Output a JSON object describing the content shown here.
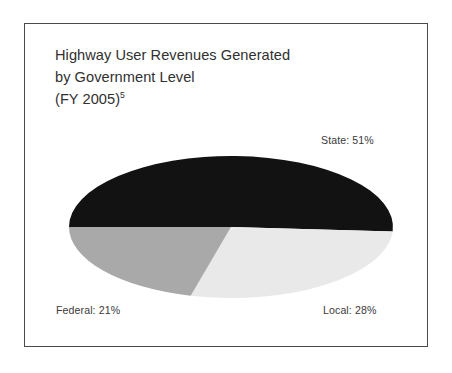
{
  "page": {
    "clipped_header_text": "             "
  },
  "figure": {
    "title_line_1": "Highway User Revenues Generated",
    "title_line_2": "by Government Level",
    "title_line_3_main": "(FY 2005)",
    "title_line_3_footnote": "5",
    "labels": {
      "state": "State: 51%",
      "federal": "Federal: 21%",
      "local": "Local: 28%"
    }
  },
  "chart_data": {
    "type": "pie",
    "title": "Highway User Revenues Generated by Government Level (FY 2005)",
    "subtitle": "",
    "xlabel": "",
    "ylabel": "",
    "unit": "percent",
    "categories": [
      "State",
      "Local",
      "Federal"
    ],
    "values": [
      51,
      28,
      21
    ],
    "labels": [
      "State: 51%",
      "Local: 28%",
      "Federal: 21%"
    ],
    "colors": [
      "#121212",
      "#e9e9e9",
      "#a9a9a9"
    ],
    "legend": "none",
    "legend_position": "outside-labels",
    "grid": false,
    "start_angle_deg": 180,
    "direction": "clockwise",
    "projection": "flattened-ellipse",
    "geometry": {
      "center_x": 206,
      "center_y": 203,
      "radius_x": 162,
      "radius_y": 71
    },
    "footnote_marker": "5",
    "total": 100
  }
}
